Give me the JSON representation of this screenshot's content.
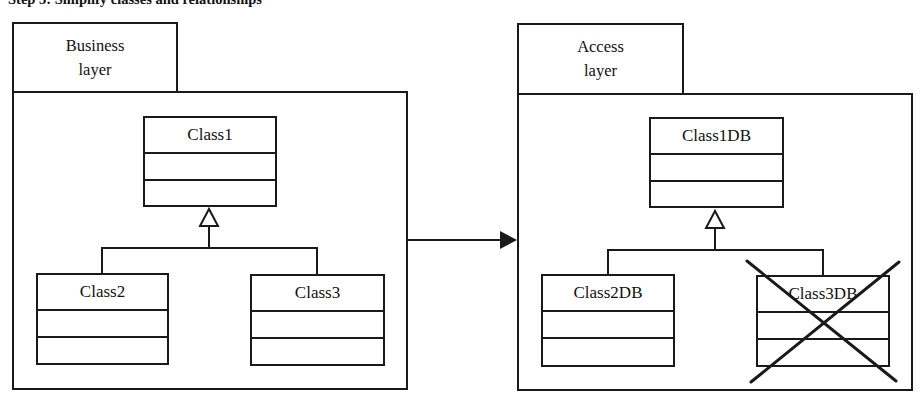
{
  "title": "Step 3: Simplify classes and relationships",
  "packages": [
    {
      "tab_label": [
        "Business",
        "layer"
      ],
      "classes": [
        {
          "name": "Class1",
          "role": "parent"
        },
        {
          "name": "Class2",
          "role": "child"
        },
        {
          "name": "Class3",
          "role": "child"
        }
      ]
    },
    {
      "tab_label": [
        "Access",
        "layer"
      ],
      "classes": [
        {
          "name": "Class1DB",
          "role": "parent"
        },
        {
          "name": "Class2DB",
          "role": "child"
        },
        {
          "name": "Class3DB",
          "role": "child",
          "crossed_out": true
        }
      ]
    }
  ],
  "arrow": {
    "from": "Business layer",
    "to": "Access layer",
    "type": "filled-arrow"
  },
  "colors": {
    "stroke": "#1a1a1a",
    "background": "#ffffff"
  }
}
